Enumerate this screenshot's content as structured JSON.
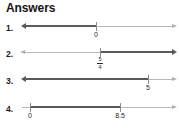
{
  "header": {
    "title": "Answers"
  },
  "answers": [
    {
      "number": "1.",
      "ticks": [
        {
          "label": "0",
          "type": "plain"
        }
      ],
      "direction": "left"
    },
    {
      "number": "2.",
      "ticks": [
        {
          "label": "5/4",
          "type": "fraction",
          "numerator": "5",
          "denominator": "4"
        }
      ],
      "direction": "right"
    },
    {
      "number": "3.",
      "ticks": [
        {
          "label": "5",
          "type": "plain"
        }
      ],
      "direction": "left"
    },
    {
      "number": "4.",
      "ticks": [
        {
          "label": "0",
          "type": "plain"
        },
        {
          "label": "8.5",
          "type": "plain"
        }
      ],
      "direction": "segment"
    }
  ],
  "colors": {
    "bold_line": "#5a5a5a",
    "thin_line": "#b8b8b8",
    "tick": "#8c8c8c",
    "text": "#1b1b1b"
  }
}
